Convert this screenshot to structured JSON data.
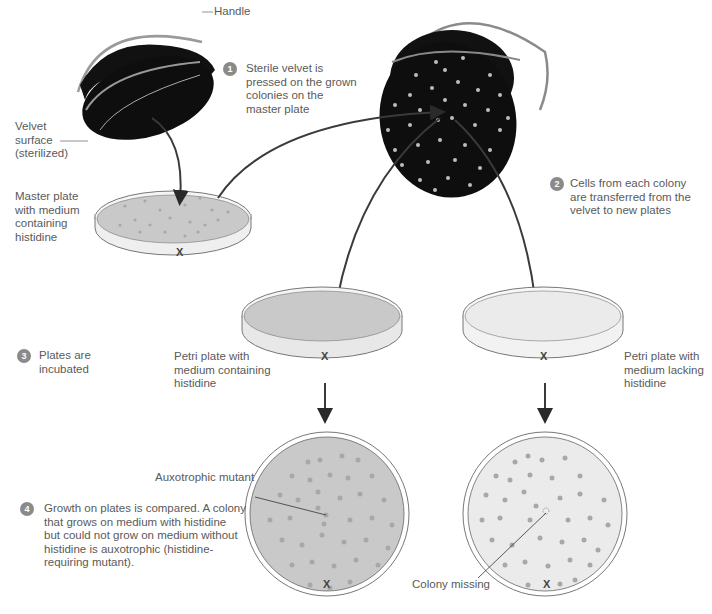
{
  "figure": {
    "colors": {
      "velvet": "#0e0e0e",
      "medium_with_histidine": "#c9c9c9",
      "medium_lacking_histidine": "#e9e9e9",
      "colony": "#a8a8a8",
      "velvet_colony": "#bdbdbd",
      "badge": "#8a8a8a",
      "arrow": "#3a3a3a"
    }
  },
  "labels": {
    "handle": "Handle",
    "velvet_surface": "Velvet\nsurface\n(sterilized)",
    "master_plate": "Master plate\nwith medium\ncontaining\nhistidine",
    "plate_with_histidine": "Petri plate with\nmedium containing\nhistidine",
    "plate_lacking_histidine": "Petri plate with\nmedium lacking\nhistidine",
    "auxotrophic_mutant": "Auxotrophic mutant",
    "colony_missing": "Colony missing",
    "x_mark": "X"
  },
  "steps": [
    {
      "number": "1",
      "text": "Sterile velvet is\npressed on the grown\ncolonies on the\nmaster plate"
    },
    {
      "number": "2",
      "text": "Cells from each colony\nare transferred from the\nvelvet to new plates"
    },
    {
      "number": "3",
      "text": "Plates are\nincubated"
    },
    {
      "number": "4",
      "text": "Growth on plates is compared.  A colony\nthat grows on medium with histidine\nbut could not grow on medium without\nhistidine is auxotrophic (histidine-\nrequiring mutant)."
    }
  ]
}
